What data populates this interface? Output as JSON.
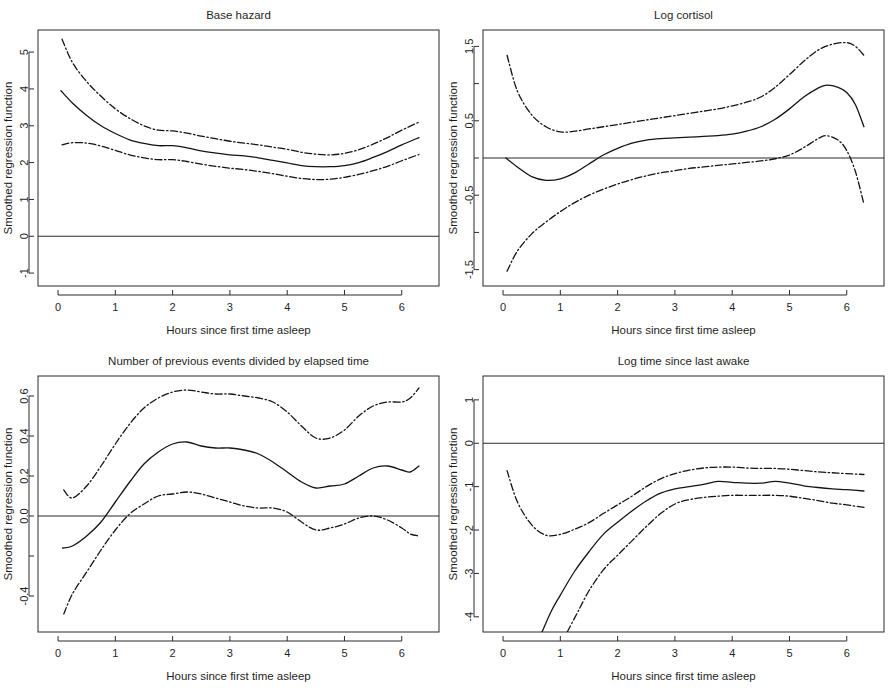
{
  "figure": {
    "width": 890,
    "height": 692,
    "background": "#ffffff",
    "line_color": "#141414",
    "axis_color": "#2b2b2b"
  },
  "common": {
    "xlabel": "Hours since first time asleep",
    "ylabel": "Smoothed regression function",
    "series_names": [
      "Upper confidence band",
      "Smoothed fit",
      "Lower confidence band"
    ]
  },
  "chart_data": [
    {
      "type": "line",
      "panel": "top-left",
      "title": "Base hazard",
      "xlabel": "Hours since first time asleep",
      "ylabel": "Smoothed regression function",
      "xlim": [
        -0.35,
        6.65
      ],
      "ylim": [
        -1.35,
        5.6
      ],
      "xticks": [
        0,
        1,
        2,
        3,
        4,
        5,
        6
      ],
      "xtick_labels": [
        "0",
        "1",
        "2",
        "3",
        "4",
        "5",
        "6"
      ],
      "yticks": [
        -1,
        0,
        1,
        2,
        3,
        4,
        5
      ],
      "ytick_labels": [
        "-1",
        "0",
        "1",
        "2",
        "3",
        "4",
        "5"
      ],
      "grid": false,
      "legend": "none",
      "zero_reference_line": 0,
      "series": [
        {
          "name": "Smoothed fit",
          "style": "solid",
          "x": [
            0.05,
            0.25,
            0.5,
            0.75,
            1.0,
            1.25,
            1.5,
            1.75,
            2.0,
            2.25,
            2.5,
            2.75,
            3.0,
            3.25,
            3.5,
            3.75,
            4.0,
            4.25,
            4.5,
            4.75,
            5.0,
            5.25,
            5.5,
            5.75,
            6.0,
            6.3
          ],
          "y": [
            3.95,
            3.62,
            3.28,
            3.0,
            2.79,
            2.62,
            2.52,
            2.46,
            2.46,
            2.4,
            2.32,
            2.26,
            2.21,
            2.18,
            2.13,
            2.06,
            1.99,
            1.92,
            1.89,
            1.89,
            1.92,
            2.0,
            2.14,
            2.3,
            2.48,
            2.68
          ]
        },
        {
          "name": "Upper confidence band",
          "style": "dashdot",
          "x": [
            0.07,
            0.25,
            0.5,
            0.75,
            1.0,
            1.25,
            1.5,
            1.75,
            2.0,
            2.25,
            2.5,
            2.75,
            3.0,
            3.25,
            3.5,
            3.75,
            4.0,
            4.25,
            4.5,
            4.75,
            5.0,
            5.25,
            5.5,
            5.75,
            6.0,
            6.3
          ],
          "y": [
            5.35,
            4.72,
            4.2,
            3.8,
            3.46,
            3.2,
            3.0,
            2.88,
            2.86,
            2.8,
            2.72,
            2.65,
            2.58,
            2.53,
            2.48,
            2.42,
            2.36,
            2.28,
            2.23,
            2.21,
            2.25,
            2.35,
            2.5,
            2.68,
            2.88,
            3.1
          ]
        },
        {
          "name": "Lower confidence band",
          "style": "dashdot",
          "x": [
            0.07,
            0.25,
            0.5,
            0.75,
            1.0,
            1.25,
            1.5,
            1.75,
            2.0,
            2.25,
            2.5,
            2.75,
            3.0,
            3.25,
            3.5,
            3.75,
            4.0,
            4.25,
            4.5,
            4.75,
            5.0,
            5.25,
            5.5,
            5.75,
            6.0,
            6.3
          ],
          "y": [
            2.48,
            2.54,
            2.53,
            2.45,
            2.33,
            2.21,
            2.13,
            2.08,
            2.08,
            2.03,
            1.96,
            1.9,
            1.85,
            1.81,
            1.76,
            1.7,
            1.63,
            1.57,
            1.54,
            1.55,
            1.6,
            1.68,
            1.78,
            1.9,
            2.05,
            2.22
          ]
        }
      ]
    },
    {
      "type": "line",
      "panel": "top-right",
      "title": "Log cortisol",
      "xlabel": "Hours since first time asleep",
      "ylabel": "Smoothed regression function",
      "xlim": [
        -0.35,
        6.65
      ],
      "ylim": [
        -1.72,
        1.72
      ],
      "xticks": [
        0,
        1,
        2,
        3,
        4,
        5,
        6
      ],
      "xtick_labels": [
        "0",
        "1",
        "2",
        "3",
        "4",
        "5",
        "6"
      ],
      "yticks": [
        -1.5,
        -1.0,
        -0.5,
        0.0,
        0.5,
        1.0,
        1.5
      ],
      "ytick_labels": [
        "-1.5",
        "",
        "-0.5",
        "",
        "0.5",
        "",
        "1.5"
      ],
      "grid": false,
      "legend": "none",
      "zero_reference_line": 0,
      "series": [
        {
          "name": "Smoothed fit",
          "style": "solid",
          "x": [
            0.05,
            0.25,
            0.5,
            0.75,
            1.0,
            1.25,
            1.5,
            1.75,
            2.0,
            2.25,
            2.5,
            2.75,
            3.0,
            3.25,
            3.5,
            3.75,
            4.0,
            4.25,
            4.5,
            4.75,
            5.0,
            5.25,
            5.5,
            5.65,
            5.85,
            6.0,
            6.15,
            6.3
          ],
          "y": [
            0.0,
            -0.12,
            -0.25,
            -0.3,
            -0.28,
            -0.2,
            -0.08,
            0.04,
            0.13,
            0.2,
            0.24,
            0.26,
            0.27,
            0.28,
            0.29,
            0.3,
            0.32,
            0.36,
            0.42,
            0.52,
            0.66,
            0.82,
            0.94,
            0.98,
            0.95,
            0.88,
            0.72,
            0.42
          ]
        },
        {
          "name": "Upper confidence band",
          "style": "dashdot",
          "x": [
            0.07,
            0.25,
            0.5,
            0.75,
            1.0,
            1.25,
            1.5,
            1.75,
            2.0,
            2.25,
            2.5,
            2.75,
            3.0,
            3.25,
            3.5,
            3.75,
            4.0,
            4.25,
            4.5,
            4.75,
            5.0,
            5.25,
            5.5,
            5.75,
            6.0,
            6.15,
            6.3
          ],
          "y": [
            1.38,
            0.9,
            0.58,
            0.42,
            0.35,
            0.36,
            0.39,
            0.42,
            0.45,
            0.48,
            0.51,
            0.54,
            0.57,
            0.6,
            0.63,
            0.66,
            0.7,
            0.75,
            0.82,
            0.95,
            1.12,
            1.3,
            1.45,
            1.53,
            1.55,
            1.5,
            1.38
          ]
        },
        {
          "name": "Lower confidence band",
          "style": "dashdot",
          "x": [
            0.07,
            0.25,
            0.5,
            0.75,
            1.0,
            1.25,
            1.5,
            1.75,
            2.0,
            2.25,
            2.5,
            2.75,
            3.0,
            3.25,
            3.5,
            3.75,
            4.0,
            4.25,
            4.5,
            4.75,
            5.0,
            5.25,
            5.5,
            5.65,
            5.85,
            6.0,
            6.15,
            6.3
          ],
          "y": [
            -1.52,
            -1.25,
            -1.02,
            -0.86,
            -0.72,
            -0.6,
            -0.5,
            -0.42,
            -0.35,
            -0.29,
            -0.24,
            -0.2,
            -0.17,
            -0.14,
            -0.12,
            -0.1,
            -0.08,
            -0.06,
            -0.04,
            -0.01,
            0.04,
            0.14,
            0.26,
            0.3,
            0.24,
            0.1,
            -0.18,
            -0.62
          ]
        }
      ]
    },
    {
      "type": "line",
      "panel": "bottom-left",
      "title": "Number of previous events divided by elapsed time",
      "xlabel": "Hours since first time asleep",
      "ylabel": "Smoothed regression function",
      "xlim": [
        -0.35,
        6.65
      ],
      "ylim": [
        -0.58,
        0.7
      ],
      "xticks": [
        0,
        1,
        2,
        3,
        4,
        5,
        6
      ],
      "xtick_labels": [
        "0",
        "1",
        "2",
        "3",
        "4",
        "5",
        "6"
      ],
      "yticks": [
        -0.4,
        -0.2,
        0.0,
        0.2,
        0.4,
        0.6
      ],
      "ytick_labels": [
        "-0.4",
        "",
        "0.0",
        "0.2",
        "0.4",
        "0.6"
      ],
      "grid": false,
      "legend": "none",
      "zero_reference_line": 0,
      "series": [
        {
          "name": "Smoothed fit",
          "style": "solid",
          "x": [
            0.08,
            0.25,
            0.5,
            0.75,
            1.0,
            1.25,
            1.5,
            1.75,
            2.0,
            2.25,
            2.5,
            2.75,
            3.0,
            3.25,
            3.5,
            3.75,
            4.0,
            4.25,
            4.5,
            4.75,
            5.0,
            5.25,
            5.5,
            5.75,
            6.0,
            6.15,
            6.3
          ],
          "y": [
            -0.16,
            -0.15,
            -0.1,
            -0.03,
            0.07,
            0.17,
            0.26,
            0.32,
            0.36,
            0.37,
            0.35,
            0.34,
            0.34,
            0.33,
            0.31,
            0.27,
            0.22,
            0.17,
            0.14,
            0.15,
            0.16,
            0.2,
            0.24,
            0.25,
            0.23,
            0.22,
            0.25
          ]
        },
        {
          "name": "Upper confidence band",
          "style": "dashdot",
          "x": [
            0.1,
            0.25,
            0.5,
            0.75,
            1.0,
            1.25,
            1.5,
            1.75,
            2.0,
            2.25,
            2.5,
            2.75,
            3.0,
            3.25,
            3.5,
            3.75,
            4.0,
            4.25,
            4.5,
            4.75,
            5.0,
            5.25,
            5.5,
            5.75,
            6.0,
            6.15,
            6.3
          ],
          "y": [
            0.13,
            0.09,
            0.15,
            0.25,
            0.36,
            0.46,
            0.54,
            0.59,
            0.62,
            0.63,
            0.62,
            0.61,
            0.61,
            0.6,
            0.59,
            0.57,
            0.52,
            0.45,
            0.39,
            0.39,
            0.43,
            0.5,
            0.55,
            0.57,
            0.57,
            0.59,
            0.64
          ]
        },
        {
          "name": "Lower confidence band",
          "style": "dashdot",
          "x": [
            0.1,
            0.25,
            0.5,
            0.75,
            1.0,
            1.25,
            1.5,
            1.75,
            2.0,
            2.25,
            2.5,
            2.75,
            3.0,
            3.25,
            3.5,
            3.75,
            4.0,
            4.25,
            4.5,
            4.75,
            5.0,
            5.25,
            5.5,
            5.75,
            6.0,
            6.15,
            6.3
          ],
          "y": [
            -0.49,
            -0.39,
            -0.28,
            -0.17,
            -0.07,
            0.01,
            0.06,
            0.1,
            0.11,
            0.12,
            0.11,
            0.09,
            0.07,
            0.05,
            0.04,
            0.04,
            0.02,
            -0.03,
            -0.07,
            -0.06,
            -0.04,
            -0.01,
            0.0,
            -0.02,
            -0.06,
            -0.09,
            -0.1
          ]
        }
      ]
    },
    {
      "type": "line",
      "panel": "bottom-right",
      "title": "Log time since last awake",
      "xlabel": "Hours since first time asleep",
      "ylabel": "Smoothed regression function",
      "xlim": [
        -0.35,
        6.65
      ],
      "ylim": [
        -4.35,
        1.55
      ],
      "xticks": [
        0,
        1,
        2,
        3,
        4,
        5,
        6
      ],
      "xtick_labels": [
        "0",
        "1",
        "2",
        "3",
        "4",
        "5",
        "6"
      ],
      "yticks": [
        -4,
        -3,
        -2,
        -1,
        0,
        1
      ],
      "ytick_labels": [
        "-4",
        "-3",
        "-2",
        "-1",
        "0",
        "1"
      ],
      "grid": false,
      "legend": "none",
      "zero_reference_line": 0,
      "series": [
        {
          "name": "Smoothed fit",
          "style": "solid",
          "x": [
            0.68,
            0.85,
            1.0,
            1.25,
            1.5,
            1.75,
            2.0,
            2.25,
            2.5,
            2.75,
            3.0,
            3.25,
            3.5,
            3.75,
            4.0,
            4.25,
            4.5,
            4.75,
            5.0,
            5.25,
            5.5,
            5.75,
            6.0,
            6.3
          ],
          "y": [
            -4.35,
            -3.85,
            -3.5,
            -2.95,
            -2.5,
            -2.1,
            -1.82,
            -1.56,
            -1.33,
            -1.15,
            -1.05,
            -1.0,
            -0.95,
            -0.88,
            -0.9,
            -0.92,
            -0.92,
            -0.88,
            -0.92,
            -0.98,
            -1.02,
            -1.05,
            -1.07,
            -1.1
          ]
        },
        {
          "name": "Upper confidence band",
          "style": "dashdot",
          "x": [
            0.07,
            0.25,
            0.5,
            0.75,
            1.0,
            1.25,
            1.5,
            1.75,
            2.0,
            2.25,
            2.5,
            2.75,
            3.0,
            3.25,
            3.5,
            3.75,
            4.0,
            4.25,
            4.5,
            4.75,
            5.0,
            5.25,
            5.5,
            5.75,
            6.0,
            6.3
          ],
          "y": [
            -0.63,
            -1.35,
            -1.88,
            -2.12,
            -2.1,
            -1.98,
            -1.83,
            -1.62,
            -1.42,
            -1.22,
            -1.0,
            -0.82,
            -0.7,
            -0.62,
            -0.57,
            -0.55,
            -0.55,
            -0.57,
            -0.58,
            -0.58,
            -0.6,
            -0.63,
            -0.66,
            -0.68,
            -0.7,
            -0.72
          ]
        },
        {
          "name": "Lower confidence band",
          "style": "dashdot",
          "x": [
            1.12,
            1.3,
            1.5,
            1.75,
            2.0,
            2.25,
            2.5,
            2.75,
            3.0,
            3.25,
            3.5,
            3.75,
            4.0,
            4.25,
            4.5,
            4.75,
            5.0,
            5.25,
            5.5,
            5.75,
            6.0,
            6.3
          ],
          "y": [
            -4.35,
            -3.9,
            -3.4,
            -2.92,
            -2.58,
            -2.25,
            -1.92,
            -1.62,
            -1.4,
            -1.3,
            -1.25,
            -1.22,
            -1.2,
            -1.2,
            -1.2,
            -1.2,
            -1.22,
            -1.27,
            -1.32,
            -1.38,
            -1.42,
            -1.48
          ]
        }
      ]
    }
  ]
}
